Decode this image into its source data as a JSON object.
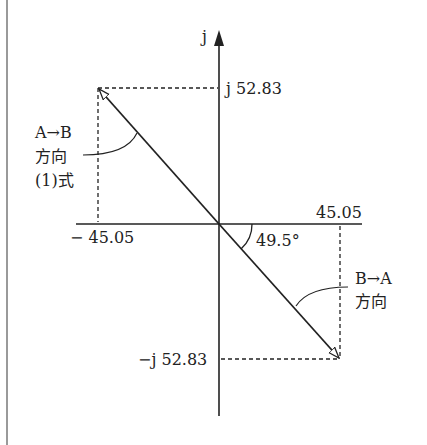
{
  "diagram": {
    "axis": {
      "imag_label": "j"
    },
    "labels": {
      "top_imag": "j 52.83",
      "bottom_imag": "−j 52.83",
      "right_real": "45.05",
      "left_real": "− 45.05",
      "angle": "49.5°",
      "ab_line1": "A→B",
      "ab_line2": "方向",
      "ab_line3": "(1)式",
      "ba_line1": "B→A",
      "ba_line2": "方向"
    },
    "vectors": [
      {
        "name": "A to B",
        "real": -45.05,
        "imag": 52.83
      },
      {
        "name": "B to A",
        "real": 45.05,
        "imag": -52.83
      }
    ],
    "angle_deg": 49.5
  }
}
